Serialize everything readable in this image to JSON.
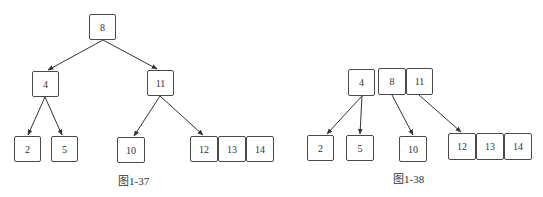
{
  "figures": [
    {
      "id": "fig-1-37",
      "caption": "图1-37",
      "description": "Binary search tree",
      "nodes": [
        {
          "key": "n8",
          "label": "8",
          "x": 89,
          "y": 14,
          "w": 27,
          "h": 26
        },
        {
          "key": "n4",
          "label": "4",
          "x": 32,
          "y": 71,
          "w": 27,
          "h": 26
        },
        {
          "key": "n11",
          "label": "11",
          "x": 147,
          "y": 70,
          "w": 27,
          "h": 26
        },
        {
          "key": "n2",
          "label": "2",
          "x": 14,
          "y": 136,
          "w": 27,
          "h": 26
        },
        {
          "key": "n5",
          "label": "5",
          "x": 51,
          "y": 136,
          "w": 27,
          "h": 26
        },
        {
          "key": "n10",
          "label": "10",
          "x": 117,
          "y": 137,
          "w": 28,
          "h": 26
        },
        {
          "key": "n12",
          "label": "12",
          "x": 190,
          "y": 136,
          "w": 28,
          "h": 26
        },
        {
          "key": "n13",
          "label": "13",
          "x": 218,
          "y": 136,
          "w": 28,
          "h": 26
        },
        {
          "key": "n14",
          "label": "14",
          "x": 246,
          "y": 136,
          "w": 28,
          "h": 26
        }
      ],
      "edges": [
        {
          "from": "8",
          "to": "4"
        },
        {
          "from": "8",
          "to": "11"
        },
        {
          "from": "4",
          "to": "2"
        },
        {
          "from": "4",
          "to": "5"
        },
        {
          "from": "11",
          "to": "10"
        },
        {
          "from": "11",
          "to": "12"
        }
      ],
      "caption_pos": {
        "x": 118,
        "y": 172
      }
    },
    {
      "id": "fig-1-38",
      "caption": "图1-38",
      "description": "Multi-key node tree",
      "nodes": [
        {
          "key": "n4",
          "label": "4",
          "x": 348,
          "y": 69,
          "w": 27,
          "h": 27
        },
        {
          "key": "n8",
          "label": "8",
          "x": 378,
          "y": 68,
          "w": 28,
          "h": 27
        },
        {
          "key": "n11",
          "label": "11",
          "x": 406,
          "y": 68,
          "w": 27,
          "h": 27
        },
        {
          "key": "n2",
          "label": "2",
          "x": 307,
          "y": 135,
          "w": 27,
          "h": 26
        },
        {
          "key": "n5",
          "label": "5",
          "x": 346,
          "y": 135,
          "w": 28,
          "h": 26
        },
        {
          "key": "n10",
          "label": "10",
          "x": 399,
          "y": 136,
          "w": 28,
          "h": 26
        },
        {
          "key": "n12",
          "label": "12",
          "x": 448,
          "y": 133,
          "w": 28,
          "h": 27
        },
        {
          "key": "n13",
          "label": "13",
          "x": 476,
          "y": 133,
          "w": 28,
          "h": 27
        },
        {
          "key": "n14",
          "label": "14",
          "x": 504,
          "y": 133,
          "w": 28,
          "h": 27
        }
      ],
      "edges": [
        {
          "from": "4",
          "to": "2"
        },
        {
          "from": "4",
          "to": "5"
        },
        {
          "from": "8",
          "to": "10"
        },
        {
          "from": "11",
          "to": "12"
        }
      ],
      "caption_pos": {
        "x": 393,
        "y": 170
      }
    }
  ]
}
